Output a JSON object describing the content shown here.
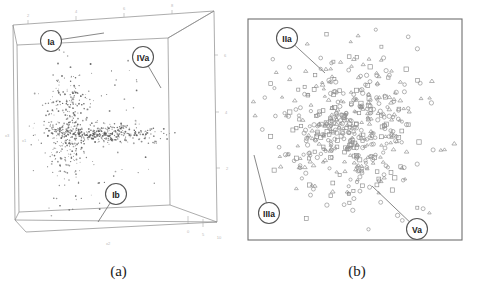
{
  "figure": {
    "panels": [
      {
        "id": "a",
        "caption": "(a)",
        "type": "3d-scatter",
        "callouts": [
          {
            "label": "Ia",
            "cx": 51,
            "cy": 41,
            "tx": 104,
            "ty": 33
          },
          {
            "label": "IVa",
            "cx": 143,
            "cy": 57,
            "tx": 161,
            "ty": 88
          },
          {
            "label": "Ib",
            "cx": 116,
            "cy": 194,
            "tx": 98,
            "ty": 222
          }
        ],
        "axis_ticks_top": [
          "2",
          "4",
          "6",
          "8"
        ],
        "axis_ticks_right": [
          "6",
          "4",
          "2"
        ],
        "axis_ticks_bottom": [
          "0",
          "5",
          "10"
        ],
        "axis_ticks_left": [
          "x3",
          "x1"
        ],
        "axis_label_bottom": "x2"
      },
      {
        "id": "b",
        "caption": "(b)",
        "type": "scatter",
        "callouts": [
          {
            "label": "IIa",
            "cx": 50,
            "cy": 38,
            "tx": 88,
            "ty": 73
          },
          {
            "label": "IIIa",
            "cx": 32,
            "cy": 213,
            "tx": 17,
            "ty": 155
          },
          {
            "label": "Va",
            "cx": 180,
            "cy": 229,
            "tx": 135,
            "ty": 186
          }
        ],
        "marker_shapes": [
          "circle",
          "triangle",
          "square"
        ]
      }
    ]
  },
  "chart_data": [
    {
      "type": "scatter",
      "title": "(a)",
      "projection": "3d",
      "xlabel": "x2",
      "ylabel": "x1",
      "zlabel": "x3",
      "axis_ticks": {
        "top": [
          "2",
          "4",
          "6",
          "8"
        ],
        "right": [
          "6",
          "4",
          "2"
        ],
        "bottom": [
          "0",
          "5",
          "10"
        ]
      },
      "grid": false,
      "legend": "none",
      "n_points": 760,
      "description": "Dense L-shaped point cloud: a vertical clump on the left merging into a horizontal band extending to the right.",
      "clusters": [
        {
          "name": "vertical-clump",
          "cx": 0.3,
          "cy": 0.48,
          "sx": 0.065,
          "sy": 0.175,
          "n": 330
        },
        {
          "name": "horizontal-band",
          "cx": 0.55,
          "cy": 0.525,
          "sx": 0.185,
          "sy": 0.032,
          "n": 330
        },
        {
          "name": "sparse-halo",
          "cx": 0.45,
          "cy": 0.5,
          "sx": 0.24,
          "sy": 0.19,
          "n": 100
        }
      ]
    },
    {
      "type": "scatter",
      "title": "(b)",
      "xlabel": "",
      "ylabel": "",
      "grid": false,
      "legend": "none",
      "n_points": 520,
      "description": "Isotropic cloud of open circles, triangles and squares, densest at centre, thinning toward the square frame.",
      "clusters": [
        {
          "name": "core",
          "cx": 0.47,
          "cy": 0.5,
          "sx": 0.135,
          "sy": 0.135,
          "n": 300
        },
        {
          "name": "outer",
          "cx": 0.49,
          "cy": 0.49,
          "sx": 0.265,
          "sy": 0.255,
          "n": 220
        }
      ],
      "series": [
        {
          "name": "circle",
          "fraction": 0.46
        },
        {
          "name": "triangle",
          "fraction": 0.32
        },
        {
          "name": "square",
          "fraction": 0.22
        }
      ]
    }
  ]
}
